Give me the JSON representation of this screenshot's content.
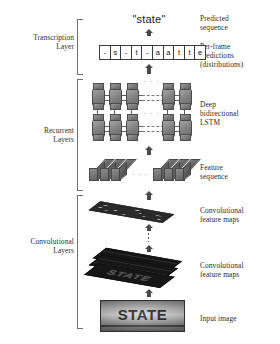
{
  "left_labels": [
    {
      "id": "transcription",
      "text": "Transcription\nLayer"
    },
    {
      "id": "recurrent",
      "text": "Recurrent\nLayers"
    },
    {
      "id": "convolutional",
      "text": "Convolutional\nLayers"
    }
  ],
  "right_labels": [
    {
      "id": "predicted-sequence",
      "text": "Predicted\nsequence"
    },
    {
      "id": "per-frame-predictions",
      "text": "Per-frame\npredictions\n(distributions)"
    },
    {
      "id": "deep-bilstm",
      "text": "Deep\nbidirectional\nLSTM"
    },
    {
      "id": "feature-sequence",
      "text": "Feature\nsequence"
    },
    {
      "id": "conv-feature-maps-top",
      "text": "Convolutional\nfeature maps"
    },
    {
      "id": "conv-feature-maps-bottom",
      "text": "Convolutional\nfeature maps"
    },
    {
      "id": "input-image",
      "text": "Input image"
    }
  ],
  "predicted_sequence": {
    "word": "\"state\""
  },
  "per_frame_predictions": {
    "frames": [
      "-",
      "s",
      "-",
      "t",
      "-",
      "a",
      "a",
      "t",
      "t",
      "e"
    ]
  },
  "recurrent": {
    "ellipsis": "· · ·",
    "layers": 2,
    "cells_per_side": 3
  },
  "feature_sequence": {
    "ellipsis": "· · ·",
    "bars_left": 3,
    "bars_right": 3
  },
  "conv_maps": {
    "map_text": "STATE"
  },
  "input_image": {
    "sign_text": "STATE"
  },
  "colors": {
    "ink": "#1a1a1a",
    "bracket": "#6f6f6f",
    "arrow": "#4a4a4a",
    "cell_fill": "#808080",
    "map_dark": "#161616"
  }
}
